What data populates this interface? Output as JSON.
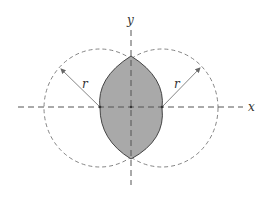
{
  "diagram": {
    "axes": {
      "x_label": "x",
      "y_label": "y"
    },
    "circles": [
      {
        "name": "left-circle",
        "radius_label": "r"
      },
      {
        "name": "right-circle",
        "radius_label": "r"
      }
    ],
    "shaded_region": "lens-shaped intersection of the two circles",
    "colors": {
      "shade": "#a9a9a9",
      "stroke": "#555555",
      "axis": "#555555",
      "circle_dash": "#777777"
    }
  }
}
